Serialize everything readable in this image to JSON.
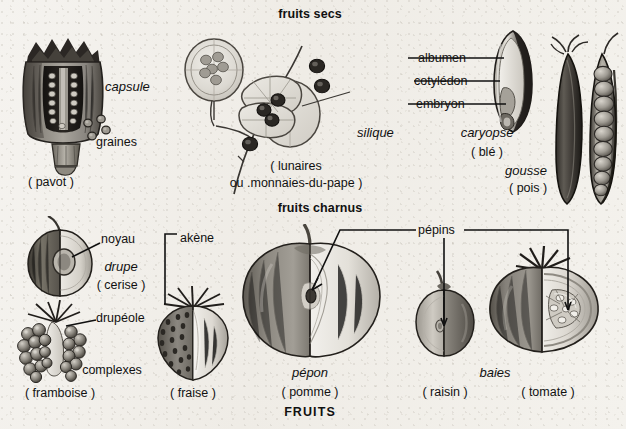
{
  "plate": {
    "title_bottom": "FRUITS",
    "section_dry": "fruits secs",
    "section_fleshy": "fruits charnus",
    "background_hex": "#f3f1ec",
    "ink_hex": "#111111"
  },
  "dry_fruits": {
    "poppy": {
      "type_label": "capsule",
      "part_label": "graines",
      "species": "( pavot )"
    },
    "honesty": {
      "type_label": "silique",
      "species_line1": "( lunaires",
      "species_line2": "ou .monnaies-du-pape )"
    },
    "wheat": {
      "type_label": "caryopse",
      "species": "( blé )",
      "parts": [
        "albumen",
        "cotylédon",
        "embryon"
      ]
    },
    "pea": {
      "type_label": "gousse",
      "species": "( pois )"
    }
  },
  "fleshy_fruits": {
    "cherry": {
      "type_label": "drupe",
      "part_label": "noyau",
      "species": "( cerise )"
    },
    "raspberry": {
      "type_label": "complexes",
      "part_label": "drupéole",
      "species": "( framboise )"
    },
    "strawberry": {
      "part_label": "akène",
      "species": "( fraise )"
    },
    "apple": {
      "type_label": "pépon",
      "species": "( pomme )"
    },
    "grape": {
      "species": "( raisin )"
    },
    "tomato": {
      "type_label": "baies",
      "species": "( tomate )"
    },
    "shared_part_label": "pépins"
  }
}
